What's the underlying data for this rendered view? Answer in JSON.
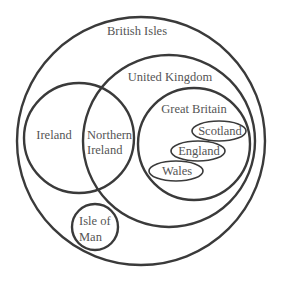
{
  "diagram": {
    "type": "euler-diagram",
    "colors": {
      "stroke": "#3a3a3a",
      "text": "#555555",
      "background": "#ffffff"
    },
    "sets": {
      "british_isles": {
        "label": "British Isles"
      },
      "united_kingdom": {
        "label": "United Kingdom"
      },
      "ireland": {
        "label": "Ireland"
      },
      "northern_ireland": {
        "label_line1": "Northern",
        "label_line2": "Ireland"
      },
      "great_britain": {
        "label": "Great Britain"
      },
      "scotland": {
        "label": "Scotland"
      },
      "england": {
        "label": "England"
      },
      "wales": {
        "label": "Wales"
      },
      "isle_of_man": {
        "label_line1": "Isle of",
        "label_line2": "Man"
      }
    }
  }
}
